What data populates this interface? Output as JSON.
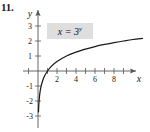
{
  "figure": {
    "problem_number": "11.",
    "equation_label": {
      "base": "x = 3",
      "exponent": "y",
      "full": "x = 3^y",
      "background_color": "#dedede"
    }
  },
  "chart_data": {
    "type": "line",
    "title": "",
    "xlabel": "x",
    "ylabel": "y",
    "equation": "x = 3^y",
    "equivalent_form": "y = log_3(x)",
    "xlim": [
      -1.5,
      11.5
    ],
    "ylim": [
      -3.8,
      3.4
    ],
    "grid": false,
    "legend": null,
    "annotations": [
      {
        "text": "x = 3^y",
        "x": 3.0,
        "y": 2.6,
        "boxed": true,
        "box_color": "#dedede"
      }
    ],
    "axes": {
      "x_ticks": [
        1,
        2,
        3,
        4,
        5,
        6,
        7,
        8,
        9,
        10
      ],
      "x_tick_labels": [
        "",
        "2",
        "",
        "4",
        "",
        "6",
        "",
        "8",
        "",
        ""
      ],
      "y_ticks": [
        -3,
        -2,
        -1,
        1,
        2,
        3
      ],
      "y_tick_labels": [
        "-3",
        "-2",
        "-1",
        "1",
        "2",
        "3"
      ],
      "x_arrow": true,
      "y_arrow": true
    },
    "series": [
      {
        "name": "x = 3^y",
        "curve_color": "#1a1a1a",
        "x": [
          0.05,
          0.08,
          0.12,
          0.2,
          0.33,
          0.5,
          0.7,
          1.0,
          1.4,
          2.0,
          3.0,
          4.0,
          5.0,
          6.0,
          7.0,
          8.0,
          9.0,
          10.0,
          11.0
        ],
        "y": [
          -2.73,
          -2.3,
          -1.93,
          -1.46,
          -1.01,
          -0.63,
          -0.32,
          0.0,
          0.31,
          0.63,
          1.0,
          1.26,
          1.46,
          1.63,
          1.77,
          1.89,
          2.0,
          2.1,
          2.18
        ]
      }
    ]
  }
}
